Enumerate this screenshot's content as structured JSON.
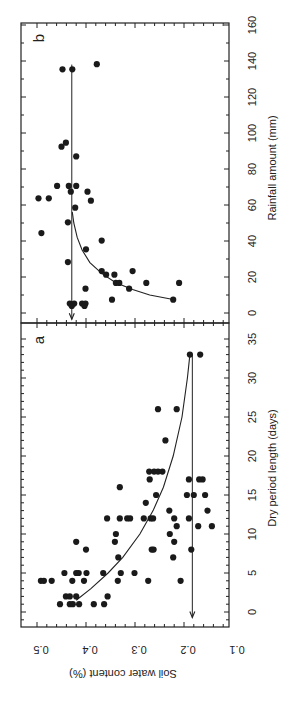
{
  "figure": {
    "orientation": "rotated-90-ccw",
    "ylabel": "Soil water content (%)",
    "yticks": [
      "0.5",
      "0.4",
      "0.3",
      "0.2",
      "0.1"
    ]
  },
  "chart_data": [
    {
      "panel": "a",
      "type": "scatter",
      "title": "",
      "panel_label": "a",
      "xlabel": "Dry period length (days)",
      "ylabel": "Soil water content (%)",
      "xlim": [
        -1.5,
        35
      ],
      "ylim": [
        0.1,
        0.53
      ],
      "xticks": [
        0,
        5,
        10,
        15,
        20,
        25,
        30,
        35
      ],
      "yticks": [
        0.1,
        0.2,
        0.3,
        0.4,
        0.5
      ],
      "grid": false,
      "points": [
        [
          1,
          0.453
        ],
        [
          1,
          0.433
        ],
        [
          1,
          0.427
        ],
        [
          1,
          0.414
        ],
        [
          1,
          0.384
        ],
        [
          1,
          0.363
        ],
        [
          2,
          0.441
        ],
        [
          2,
          0.433
        ],
        [
          2,
          0.42
        ],
        [
          2,
          0.356
        ],
        [
          4,
          0.492
        ],
        [
          4,
          0.486
        ],
        [
          4,
          0.47
        ],
        [
          4,
          0.428
        ],
        [
          4,
          0.404
        ],
        [
          4,
          0.335
        ],
        [
          4,
          0.273
        ],
        [
          4,
          0.207
        ],
        [
          5,
          0.444
        ],
        [
          5,
          0.42
        ],
        [
          5,
          0.415
        ],
        [
          5,
          0.399
        ],
        [
          5,
          0.365
        ],
        [
          5,
          0.329
        ],
        [
          5,
          0.301
        ],
        [
          7,
          0.334
        ],
        [
          7,
          0.222
        ],
        [
          8,
          0.4
        ],
        [
          8,
          0.266
        ],
        [
          8,
          0.262
        ],
        [
          8,
          0.185
        ],
        [
          9,
          0.42
        ],
        [
          9,
          0.341
        ],
        [
          9,
          0.22
        ],
        [
          10,
          0.339
        ],
        [
          10,
          0.229
        ],
        [
          11,
          0.215
        ],
        [
          11,
          0.171
        ],
        [
          11,
          0.143
        ],
        [
          12,
          0.357
        ],
        [
          12,
          0.331
        ],
        [
          12,
          0.316
        ],
        [
          12,
          0.31
        ],
        [
          12,
          0.282
        ],
        [
          12,
          0.268
        ],
        [
          12,
          0.263
        ],
        [
          12,
          0.22
        ],
        [
          12,
          0.19
        ],
        [
          13,
          0.23
        ],
        [
          13,
          0.152
        ],
        [
          14,
          0.278
        ],
        [
          15,
          0.257
        ],
        [
          15,
          0.194
        ],
        [
          15,
          0.18
        ],
        [
          15,
          0.157
        ],
        [
          16,
          0.331
        ],
        [
          17,
          0.27
        ],
        [
          17,
          0.19
        ],
        [
          17,
          0.169
        ],
        [
          17,
          0.162
        ],
        [
          18,
          0.271
        ],
        [
          18,
          0.261
        ],
        [
          18,
          0.253
        ],
        [
          18,
          0.244
        ],
        [
          22,
          0.238
        ],
        [
          26,
          0.253
        ],
        [
          26,
          0.215
        ],
        [
          33,
          0.188
        ],
        [
          33,
          0.167
        ]
      ],
      "fit_curve": [
        [
          1.5,
          0.42
        ],
        [
          3,
          0.39
        ],
        [
          5,
          0.355
        ],
        [
          7,
          0.325
        ],
        [
          10,
          0.29
        ],
        [
          13,
          0.263
        ],
        [
          16,
          0.242
        ],
        [
          20,
          0.222
        ],
        [
          25,
          0.204
        ],
        [
          30,
          0.193
        ],
        [
          33,
          0.188
        ]
      ],
      "asymptote": {
        "value": 0.183,
        "from": 33,
        "to": -0.7,
        "arrow": true
      }
    },
    {
      "panel": "b",
      "type": "scatter",
      "title": "",
      "panel_label": "b",
      "xlabel": "Rainfall amount (mm)",
      "ylabel": "Soil water content (%)",
      "xlim": [
        -5,
        160
      ],
      "ylim": [
        0.1,
        0.53
      ],
      "xticks": [
        0,
        20,
        40,
        60,
        80,
        100,
        120,
        140,
        160
      ],
      "yticks": [
        0.1,
        0.2,
        0.3,
        0.4,
        0.5
      ],
      "grid": false,
      "points": [
        [
          135.4,
          0.448
        ],
        [
          135.4,
          0.428
        ],
        [
          138.2,
          0.378
        ],
        [
          92.4,
          0.45
        ],
        [
          94.6,
          0.441
        ],
        [
          87,
          0.42
        ],
        [
          70.6,
          0.459
        ],
        [
          70.6,
          0.435
        ],
        [
          70.6,
          0.42
        ],
        [
          67.4,
          0.431
        ],
        [
          67.4,
          0.397
        ],
        [
          63.7,
          0.497
        ],
        [
          63.7,
          0.476
        ],
        [
          62.4,
          0.39
        ],
        [
          58.5,
          0.422
        ],
        [
          50.4,
          0.437
        ],
        [
          44.4,
          0.491
        ],
        [
          40.2,
          0.368
        ],
        [
          35.4,
          0.4
        ],
        [
          28.3,
          0.437
        ],
        [
          23.3,
          0.368
        ],
        [
          23.3,
          0.305
        ],
        [
          21.3,
          0.359
        ],
        [
          21.3,
          0.342
        ],
        [
          16.7,
          0.339
        ],
        [
          16.7,
          0.332
        ],
        [
          16.7,
          0.277
        ],
        [
          16.7,
          0.21
        ],
        [
          13.5,
          0.401
        ],
        [
          13.5,
          0.312
        ],
        [
          7.4,
          0.347
        ],
        [
          7.4,
          0.222
        ],
        [
          5.2,
          0.433
        ],
        [
          5.2,
          0.424
        ],
        [
          5.2,
          0.408
        ],
        [
          5.2,
          0.401
        ],
        [
          3.9,
          0.429
        ],
        [
          3.9,
          0.403
        ]
      ],
      "fit_curve": [
        [
          7.5,
          0.222
        ],
        [
          10,
          0.27
        ],
        [
          13,
          0.305
        ],
        [
          17,
          0.34
        ],
        [
          22,
          0.368
        ],
        [
          28,
          0.392
        ],
        [
          35,
          0.408
        ],
        [
          42,
          0.418
        ],
        [
          50,
          0.425
        ],
        [
          56,
          0.428
        ]
      ],
      "asymptote": {
        "value": 0.429,
        "from": 138,
        "to": -3.5,
        "arrow": true
      }
    }
  ]
}
